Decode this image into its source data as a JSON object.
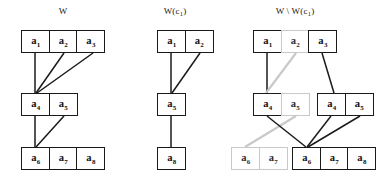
{
  "figure": {
    "caption_free": true,
    "background": "#ffffff",
    "edge_colors": {
      "dark": "#1a1a1a",
      "gray": "#c9c9c9"
    },
    "border_colors": {
      "dark": "#1a1a1a",
      "gray": "#c9c9c9"
    }
  },
  "panels": [
    {
      "id": "panel-w",
      "title": "W",
      "title_base": "W",
      "title_sub": "",
      "groups": [
        {
          "id": "w-top",
          "x": 21,
          "y": 30,
          "cells": [
            {
              "base": "a",
              "sub": "1",
              "tone": "dark"
            },
            {
              "base": "a",
              "sub": "2",
              "tone": "dark"
            },
            {
              "base": "a",
              "sub": "3",
              "tone": "dark"
            }
          ]
        },
        {
          "id": "w-mid",
          "x": 21,
          "y": 93,
          "cells": [
            {
              "base": "a",
              "sub": "4",
              "tone": "dark"
            },
            {
              "base": "a",
              "sub": "5",
              "tone": "dark"
            }
          ]
        },
        {
          "id": "w-bot",
          "x": 21,
          "y": 147,
          "cells": [
            {
              "base": "a",
              "sub": "6",
              "tone": "dark"
            },
            {
              "base": "a",
              "sub": "7",
              "tone": "dark"
            },
            {
              "base": "a",
              "sub": "8",
              "tone": "dark"
            }
          ]
        }
      ],
      "edges": [
        {
          "from": "a1",
          "to": "a4",
          "x1": 35,
          "y1": 53,
          "x2": 35,
          "y2": 93,
          "tone": "dark"
        },
        {
          "from": "a2",
          "to": "a4",
          "x1": 64,
          "y1": 53,
          "x2": 36,
          "y2": 93,
          "tone": "dark"
        },
        {
          "from": "a3",
          "to": "a4",
          "x1": 93,
          "y1": 53,
          "x2": 37,
          "y2": 93,
          "tone": "dark"
        },
        {
          "from": "a4",
          "to": "a6",
          "x1": 35,
          "y1": 116,
          "x2": 35,
          "y2": 147,
          "tone": "dark"
        },
        {
          "from": "a5",
          "to": "a6",
          "x1": 64,
          "y1": 116,
          "x2": 36,
          "y2": 147,
          "tone": "dark"
        }
      ]
    },
    {
      "id": "panel-wc1",
      "title": "W(c1)",
      "title_base": "W(c",
      "title_sub": "1",
      "title_tail": ")",
      "groups": [
        {
          "id": "wc-top",
          "x": 157,
          "y": 30,
          "cells": [
            {
              "base": "a",
              "sub": "1",
              "tone": "dark"
            },
            {
              "base": "a",
              "sub": "2",
              "tone": "dark"
            }
          ]
        },
        {
          "id": "wc-mid",
          "x": 157,
          "y": 93,
          "cells": [
            {
              "base": "a",
              "sub": "5",
              "tone": "dark"
            }
          ]
        },
        {
          "id": "wc-bot",
          "x": 157,
          "y": 147,
          "cells": [
            {
              "base": "a",
              "sub": "8",
              "tone": "dark"
            }
          ]
        }
      ],
      "edges": [
        {
          "from": "a1",
          "to": "a5",
          "x1": 171,
          "y1": 53,
          "x2": 171,
          "y2": 93,
          "tone": "dark"
        },
        {
          "from": "a2",
          "to": "a5",
          "x1": 200,
          "y1": 53,
          "x2": 172,
          "y2": 93,
          "tone": "dark"
        },
        {
          "from": "a5",
          "to": "a8",
          "x1": 171,
          "y1": 116,
          "x2": 171,
          "y2": 147,
          "tone": "dark"
        }
      ]
    },
    {
      "id": "panel-w-minus-wc1",
      "title": "W \\ W(c1)",
      "title_base": "W \\ W(c",
      "title_sub": "1",
      "title_tail": ")",
      "groups": [
        {
          "id": "d-top",
          "x": 253,
          "y": 30,
          "cells": [
            {
              "base": "a",
              "sub": "1",
              "tone": "dark"
            },
            {
              "base": "a",
              "sub": "2",
              "tone": "gray"
            },
            {
              "base": "a",
              "sub": "3",
              "tone": "dark"
            }
          ]
        },
        {
          "id": "d-mid-left",
          "x": 253,
          "y": 93,
          "cells": [
            {
              "base": "a",
              "sub": "4",
              "tone": "dark"
            },
            {
              "base": "a",
              "sub": "5",
              "tone": "gray"
            }
          ]
        },
        {
          "id": "d-mid-right",
          "x": 317,
          "y": 93,
          "cells": [
            {
              "base": "a",
              "sub": "4",
              "tone": "dark"
            },
            {
              "base": "a",
              "sub": "5",
              "tone": "dark"
            }
          ]
        },
        {
          "id": "d-bot-left",
          "x": 231,
          "y": 147,
          "cells": [
            {
              "base": "a",
              "sub": "6",
              "tone": "gray"
            },
            {
              "base": "a",
              "sub": "7",
              "tone": "gray"
            }
          ]
        },
        {
          "id": "d-bot-right",
          "x": 292,
          "y": 147,
          "cells": [
            {
              "base": "a",
              "sub": "6",
              "tone": "dark"
            },
            {
              "base": "a",
              "sub": "7",
              "tone": "dark"
            },
            {
              "base": "a",
              "sub": "8",
              "tone": "dark"
            }
          ]
        }
      ],
      "edges": [
        {
          "from": "a1",
          "to": "a4-left",
          "x1": 267,
          "y1": 53,
          "x2": 267,
          "y2": 93,
          "tone": "dark"
        },
        {
          "from": "a2",
          "to": "a4-left",
          "x1": 296,
          "y1": 53,
          "x2": 266,
          "y2": 93,
          "tone": "gray"
        },
        {
          "from": "a3",
          "to": "a4-right",
          "x1": 322,
          "y1": 53,
          "x2": 334,
          "y2": 93,
          "tone": "dark"
        },
        {
          "from": "a5-left",
          "to": "a6-left",
          "x1": 296,
          "y1": 116,
          "x2": 245,
          "y2": 147,
          "tone": "gray"
        },
        {
          "from": "a4-left",
          "to": "a6-right",
          "x1": 267,
          "y1": 116,
          "x2": 306,
          "y2": 147,
          "tone": "dark"
        },
        {
          "from": "a4-right",
          "to": "a6-right",
          "x1": 331,
          "y1": 116,
          "x2": 307,
          "y2": 147,
          "tone": "dark"
        },
        {
          "from": "a5-right",
          "to": "a6-right",
          "x1": 360,
          "y1": 116,
          "x2": 308,
          "y2": 147,
          "tone": "dark"
        }
      ]
    }
  ],
  "titles": {
    "panel1": {
      "x": 63,
      "y": 12
    },
    "panel2": {
      "x": 175,
      "y": 12
    },
    "panel3": {
      "x": 295,
      "y": 12
    }
  }
}
